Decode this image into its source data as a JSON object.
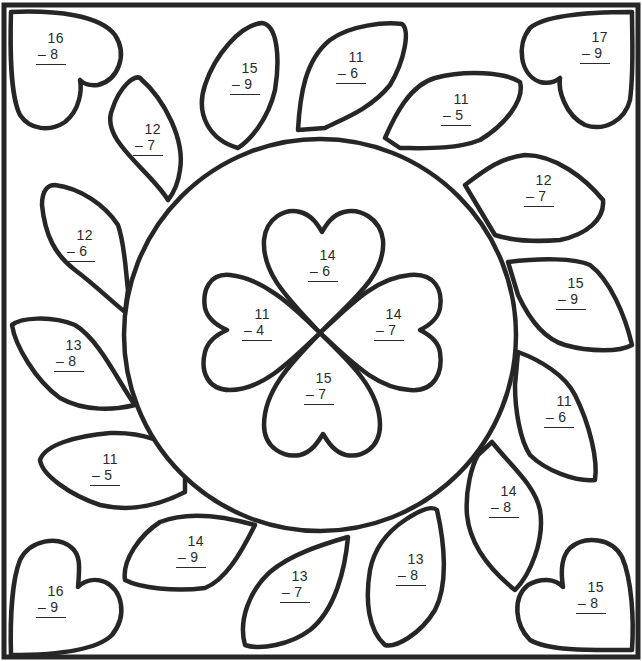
{
  "worksheet": {
    "operation": "subtraction",
    "minus_sign": "–",
    "line_color": "#262626",
    "background": "#ffffff"
  },
  "corner_hearts": [
    {
      "position": "top-left",
      "minuend": "16",
      "subtrahend": "8"
    },
    {
      "position": "top-right",
      "minuend": "17",
      "subtrahend": "9"
    },
    {
      "position": "bottom-left",
      "minuend": "16",
      "subtrahend": "9"
    },
    {
      "position": "bottom-right",
      "minuend": "15",
      "subtrahend": "8"
    }
  ],
  "petals": [
    {
      "position": "top-left-1",
      "minuend": "12",
      "subtrahend": "7"
    },
    {
      "position": "top-1",
      "minuend": "15",
      "subtrahend": "9"
    },
    {
      "position": "top-2",
      "minuend": "11",
      "subtrahend": "6"
    },
    {
      "position": "top-right-1",
      "minuend": "11",
      "subtrahend": "5"
    },
    {
      "position": "right-1",
      "minuend": "12",
      "subtrahend": "7"
    },
    {
      "position": "right-2",
      "minuend": "15",
      "subtrahend": "9"
    },
    {
      "position": "right-3",
      "minuend": "11",
      "subtrahend": "6"
    },
    {
      "position": "bottom-right-1",
      "minuend": "14",
      "subtrahend": "8"
    },
    {
      "position": "bottom-1",
      "minuend": "13",
      "subtrahend": "8"
    },
    {
      "position": "bottom-2",
      "minuend": "13",
      "subtrahend": "7"
    },
    {
      "position": "bottom-left-1",
      "minuend": "14",
      "subtrahend": "9"
    },
    {
      "position": "left-1",
      "minuend": "11",
      "subtrahend": "5"
    },
    {
      "position": "left-2",
      "minuend": "13",
      "subtrahend": "8"
    },
    {
      "position": "left-3",
      "minuend": "12",
      "subtrahend": "6"
    }
  ],
  "clover_leaves": [
    {
      "position": "top",
      "minuend": "14",
      "subtrahend": "6"
    },
    {
      "position": "left",
      "minuend": "11",
      "subtrahend": "4"
    },
    {
      "position": "right",
      "minuend": "14",
      "subtrahend": "7"
    },
    {
      "position": "bottom",
      "minuend": "15",
      "subtrahend": "7"
    }
  ]
}
